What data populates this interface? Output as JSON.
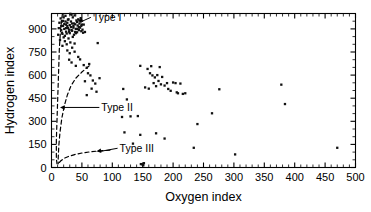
{
  "chart_data": {
    "type": "scatter",
    "title": "",
    "xlabel": "Oxygen index",
    "ylabel": "Hydrogen index",
    "xlim": [
      0,
      500
    ],
    "ylim": [
      0,
      1000
    ],
    "xticks": [
      0,
      50,
      100,
      150,
      200,
      250,
      300,
      350,
      400,
      450,
      500
    ],
    "yticks": [
      0,
      150,
      300,
      450,
      600,
      750,
      900
    ],
    "xtick_labels": [
      "0",
      "50",
      "100",
      "150",
      "200",
      "250",
      "300",
      "350",
      "400",
      "450",
      "500"
    ],
    "ytick_labels": [
      "0",
      "150",
      "300",
      "450",
      "600",
      "750",
      "900"
    ],
    "x_minor_step": 10,
    "y_minor_step": 50,
    "grid": false,
    "legend": "none",
    "marker": "square",
    "marker_color": "#111111",
    "frame_color": "#000000",
    "annotations": [
      {
        "text": "Type I",
        "label_x": 68,
        "label_y": 975,
        "arrow_to_x": 44,
        "arrow_to_y": 950
      },
      {
        "text": "Type II",
        "label_x": 82,
        "label_y": 390,
        "arrow_to_x": 14,
        "arrow_to_y": 390
      },
      {
        "text": "Type III",
        "label_x": 112,
        "label_y": 125,
        "arrow_to_x": 74,
        "arrow_to_y": 105
      }
    ],
    "maturation_paths": [
      {
        "name": "Type I path",
        "points": [
          [
            18,
            1000
          ],
          [
            15,
            900
          ],
          [
            13,
            780
          ],
          [
            12,
            660
          ],
          [
            11,
            540
          ],
          [
            10,
            420
          ],
          [
            9,
            300
          ],
          [
            8,
            180
          ],
          [
            8,
            60
          ],
          [
            9,
            25
          ]
        ]
      },
      {
        "name": "Type II path",
        "points": [
          [
            62,
            660
          ],
          [
            50,
            620
          ],
          [
            40,
            580
          ],
          [
            32,
            530
          ],
          [
            26,
            470
          ],
          [
            21,
            400
          ],
          [
            17,
            320
          ],
          [
            14,
            230
          ],
          [
            12,
            140
          ],
          [
            11,
            60
          ],
          [
            11,
            25
          ]
        ]
      },
      {
        "name": "Type III path",
        "points": [
          [
            96,
            112
          ],
          [
            80,
            108
          ],
          [
            64,
            102
          ],
          [
            50,
            94
          ],
          [
            38,
            84
          ],
          [
            28,
            72
          ],
          [
            20,
            58
          ],
          [
            15,
            42
          ],
          [
            12,
            28
          ],
          [
            11,
            20
          ]
        ]
      }
    ],
    "points": [
      [
        11,
        862
      ],
      [
        12,
        905
      ],
      [
        13,
        940
      ],
      [
        14,
        828
      ],
      [
        15,
        968
      ],
      [
        16,
        892
      ],
      [
        17,
        948
      ],
      [
        18,
        868
      ],
      [
        19,
        920
      ],
      [
        20,
        975
      ],
      [
        21,
        900
      ],
      [
        22,
        855
      ],
      [
        23,
        985
      ],
      [
        24,
        928
      ],
      [
        25,
        870
      ],
      [
        26,
        940
      ],
      [
        27,
        905
      ],
      [
        28,
        962
      ],
      [
        29,
        882
      ],
      [
        30,
        925
      ],
      [
        31,
        998
      ],
      [
        32,
        948
      ],
      [
        33,
        892
      ],
      [
        34,
        935
      ],
      [
        35,
        975
      ],
      [
        36,
        908
      ],
      [
        37,
        862
      ],
      [
        38,
        988
      ],
      [
        39,
        930
      ],
      [
        40,
        900
      ],
      [
        41,
        955
      ],
      [
        42,
        878
      ],
      [
        43,
        922
      ],
      [
        44,
        962
      ],
      [
        45,
        892
      ],
      [
        46,
        935
      ],
      [
        47,
        908
      ],
      [
        48,
        970
      ],
      [
        49,
        885
      ],
      [
        50,
        928
      ],
      [
        22,
        820
      ],
      [
        25,
        800
      ],
      [
        28,
        838
      ],
      [
        31,
        812
      ],
      [
        18,
        790
      ],
      [
        35,
        848
      ],
      [
        38,
        805
      ],
      [
        20,
        845
      ],
      [
        24,
        882
      ],
      [
        27,
        960
      ],
      [
        30,
        872
      ],
      [
        33,
        992
      ],
      [
        36,
        918
      ],
      [
        39,
        880
      ],
      [
        42,
        945
      ],
      [
        45,
        912
      ],
      [
        48,
        948
      ],
      [
        51,
        895
      ],
      [
        53,
        928
      ],
      [
        55,
        880
      ],
      [
        24,
        905
      ],
      [
        26,
        918
      ],
      [
        29,
        895
      ],
      [
        32,
        912
      ],
      [
        16,
        918
      ],
      [
        17,
        875
      ],
      [
        19,
        952
      ],
      [
        21,
        932
      ],
      [
        23,
        948
      ],
      [
        34,
        888
      ],
      [
        37,
        935
      ],
      [
        40,
        872
      ],
      [
        43,
        900
      ],
      [
        46,
        955
      ],
      [
        49,
        920
      ],
      [
        52,
        875
      ],
      [
        26,
        760
      ],
      [
        30,
        742
      ],
      [
        34,
        778
      ],
      [
        38,
        752
      ],
      [
        29,
        700
      ],
      [
        33,
        682
      ],
      [
        44,
        718
      ],
      [
        40,
        660
      ],
      [
        47,
        702
      ],
      [
        53,
        665
      ],
      [
        58,
        648
      ],
      [
        62,
        672
      ],
      [
        60,
        612
      ],
      [
        64,
        598
      ],
      [
        55,
        560
      ],
      [
        68,
        565
      ],
      [
        72,
        545
      ],
      [
        76,
        808
      ],
      [
        79,
        580
      ],
      [
        74,
        492
      ],
      [
        66,
        512
      ],
      [
        58,
        470
      ],
      [
        118,
        510
      ],
      [
        124,
        442
      ],
      [
        116,
        328
      ],
      [
        130,
        332
      ],
      [
        142,
        334
      ],
      [
        120,
        228
      ],
      [
        134,
        155
      ],
      [
        146,
        212
      ],
      [
        147,
        22
      ],
      [
        150,
        18
      ],
      [
        152,
        28
      ],
      [
        151,
        14
      ],
      [
        146,
        660
      ],
      [
        158,
        640
      ],
      [
        162,
        612
      ],
      [
        166,
        598
      ],
      [
        164,
        658
      ],
      [
        170,
        585
      ],
      [
        174,
        600
      ],
      [
        178,
        652
      ],
      [
        168,
        548
      ],
      [
        172,
        528
      ],
      [
        176,
        562
      ],
      [
        180,
        540
      ],
      [
        182,
        588
      ],
      [
        186,
        532
      ],
      [
        190,
        548
      ],
      [
        196,
        498
      ],
      [
        200,
        552
      ],
      [
        204,
        548
      ],
      [
        208,
        482
      ],
      [
        212,
        545
      ],
      [
        216,
        478
      ],
      [
        220,
        482
      ],
      [
        160,
        512
      ],
      [
        154,
        520
      ],
      [
        192,
        510
      ],
      [
        206,
        488
      ],
      [
        172,
        222
      ],
      [
        186,
        188
      ],
      [
        234,
        128
      ],
      [
        240,
        282
      ],
      [
        264,
        352
      ],
      [
        276,
        508
      ],
      [
        302,
        85
      ],
      [
        378,
        538
      ],
      [
        384,
        412
      ],
      [
        470,
        128
      ]
    ]
  }
}
